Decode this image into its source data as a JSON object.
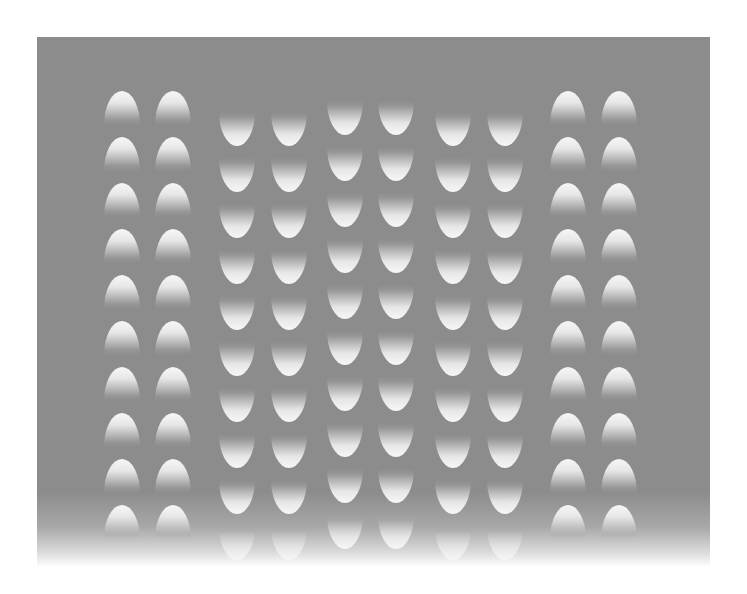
{
  "image": {
    "description": "Optical illusion: grid of gradient-shaded egg shapes on a gray panel",
    "background_color": "#ffffff",
    "panel_color": "#8c8c8c",
    "egg_highlight_color": "#f7f7f7"
  },
  "layout": {
    "row_pitch": 46,
    "egg_width": 36,
    "egg_height": 34,
    "rows": 10
  },
  "columns": [
    {
      "x": 104,
      "top": 91,
      "orientation": "up"
    },
    {
      "x": 155,
      "top": 91,
      "orientation": "up"
    },
    {
      "x": 219,
      "top": 112,
      "orientation": "down"
    },
    {
      "x": 271,
      "top": 112,
      "orientation": "down"
    },
    {
      "x": 327,
      "top": 101,
      "orientation": "down"
    },
    {
      "x": 378,
      "top": 101,
      "orientation": "down"
    },
    {
      "x": 435,
      "top": 112,
      "orientation": "down"
    },
    {
      "x": 487,
      "top": 112,
      "orientation": "down"
    },
    {
      "x": 550,
      "top": 91,
      "orientation": "up"
    },
    {
      "x": 601,
      "top": 91,
      "orientation": "up"
    }
  ]
}
